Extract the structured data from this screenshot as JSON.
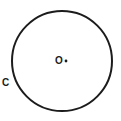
{
  "figure": {
    "kind": "geometry-diagram",
    "background_color": "#ffffff",
    "stroke_color": "#1c1c1c",
    "canvas": {
      "width": 121,
      "height": 121
    },
    "circle": {
      "name": "main-circle",
      "center_x": 62,
      "center_y": 61,
      "radius": 50,
      "stroke_width": 2,
      "fill": "none"
    },
    "center_point": {
      "name": "center-dot",
      "x": 66,
      "y": 61,
      "radius": 1.4
    },
    "labels": {
      "center": "O",
      "point_c": "C"
    }
  }
}
